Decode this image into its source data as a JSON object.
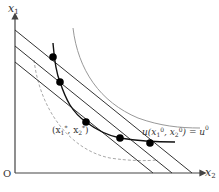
{
  "diagram": {
    "axes": {
      "y_label": "x",
      "y_label_sub": "1",
      "x_label": "x",
      "x_label_sub": "2",
      "origin_label": "O"
    },
    "labels": {
      "optimum_open": "(x",
      "optimum_sub1": "1",
      "optimum_sup1": "*",
      "optimum_mid": ", x",
      "optimum_sub2": "2",
      "optimum_sup2": "*",
      "optimum_close": ")",
      "utility_prefix": "u(x",
      "utility_sub1": "1",
      "utility_sup1": "0",
      "utility_mid": ", x",
      "utility_sub2": "2",
      "utility_sup2": "0",
      "utility_suffix": ") = u",
      "utility_sup3": "0"
    },
    "colors": {
      "axis": "#444444",
      "budget_line": "#333333",
      "indifference_curve": "#999999",
      "expansion_path": "#111111",
      "dashed_curve": "#aaaaaa",
      "point": "#000000"
    }
  }
}
